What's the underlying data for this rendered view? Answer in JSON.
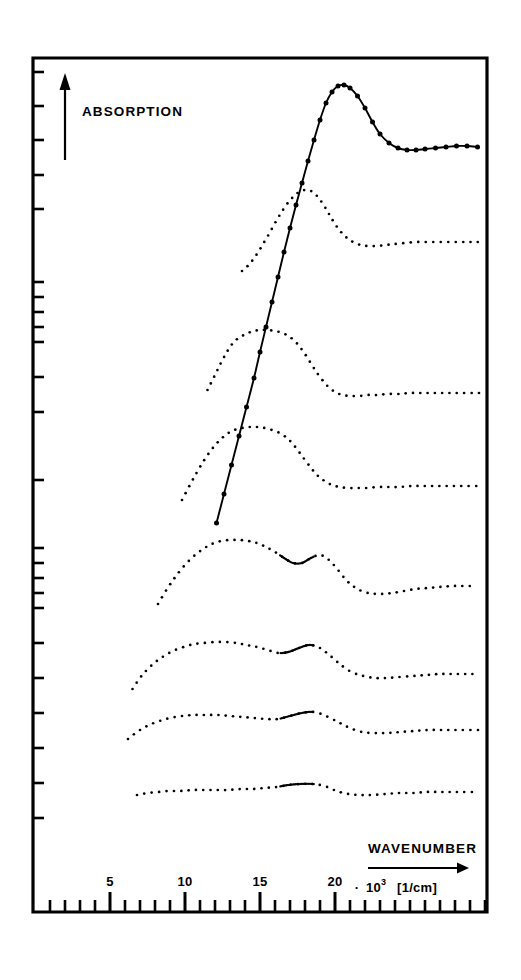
{
  "figure": {
    "title_visible": "",
    "background_color": "#ffffff",
    "ink_color": "#000000",
    "frame": {
      "left": 33,
      "top": 58,
      "right": 487,
      "bottom": 912
    }
  },
  "axes": {
    "y_label": "ABSORPTION",
    "y_arrow": "up-arrow",
    "x_label": "WAVENUMBER",
    "x_arrow": "right-arrow",
    "x_unit_prefix": "·",
    "x_unit_mantissa": "10",
    "x_unit_exponent": "3",
    "x_unit_bracket": "[1/cm]",
    "x_tick_labels": [
      "5",
      "10",
      "15",
      "20"
    ],
    "x_tick_values": [
      5,
      10,
      15,
      20
    ],
    "x_minor_step": 1,
    "x_minor_values": [
      1,
      2,
      3,
      4,
      5,
      6,
      7,
      8,
      9,
      10,
      11,
      12,
      13,
      14,
      15,
      16,
      17,
      18,
      19,
      20,
      21,
      22,
      23,
      24,
      25,
      26,
      27,
      28,
      29,
      30
    ],
    "y_tick_positions": [
      72,
      106,
      140,
      175,
      209,
      282,
      297,
      312,
      327,
      342,
      377,
      412,
      480,
      548,
      563,
      578,
      593,
      608,
      643,
      678,
      713,
      748,
      783,
      818
    ],
    "y_ticks_labeled": false
  },
  "chart_data": {
    "type": "line",
    "xlabel": "WAVENUMBER · 10^3 [1/cm]",
    "ylabel": "ABSORPTION",
    "xlim": [
      1,
      31
    ],
    "grid": false,
    "legend": "none",
    "x_pixel_scale": {
      "x_at_value_5": 110,
      "pixels_per_unit": 15
    },
    "series": [
      {
        "name": "spectrum-1",
        "style": "solid-with-markers",
        "marker": "filled-circle",
        "x": [
          12.1,
          12.6,
          13.1,
          13.6,
          14.1,
          14.6,
          15.0,
          15.4,
          15.8,
          16.2,
          16.6,
          17.0,
          17.4,
          17.8,
          18.2,
          18.6,
          19.0,
          19.4,
          19.8,
          20.2,
          20.6,
          21.0,
          21.5,
          22.0,
          22.5,
          23.0,
          23.6,
          24.2,
          24.8,
          25.4,
          26.0,
          26.7,
          27.4,
          28.1,
          28.8,
          29.5
        ],
        "y_pixels": [
          523,
          494,
          465,
          436,
          407,
          378,
          352,
          327,
          302,
          277,
          252,
          228,
          205,
          183,
          161,
          140,
          120,
          103,
          92,
          86,
          85,
          88,
          96,
          108,
          122,
          134,
          143,
          148,
          150,
          150,
          149,
          148,
          147,
          146,
          146,
          147
        ]
      },
      {
        "name": "spectrum-2",
        "style": "dotted",
        "x": [
          13.8,
          14.3,
          14.8,
          15.2,
          15.6,
          16.0,
          16.4,
          16.8,
          17.2,
          17.6,
          18.0,
          18.4,
          18.8,
          19.2,
          19.6,
          20.0,
          20.4,
          20.8,
          21.2,
          21.7,
          22.2,
          22.8,
          23.4,
          24.0,
          24.7,
          25.4,
          26.1,
          26.8,
          27.5,
          28.2,
          28.9,
          29.6
        ],
        "y_pixels": [
          271,
          264,
          254,
          244,
          234,
          223,
          213,
          204,
          197,
          192,
          190,
          191,
          196,
          204,
          214,
          224,
          232,
          238,
          242,
          245,
          246,
          246,
          245,
          244,
          243,
          242,
          242,
          242,
          242,
          242,
          242,
          242
        ]
      },
      {
        "name": "spectrum-3",
        "style": "dotted",
        "x": [
          11.5,
          12.0,
          12.5,
          13.0,
          13.4,
          13.8,
          14.2,
          14.6,
          15.0,
          15.5,
          16.0,
          16.5,
          17.0,
          17.5,
          18.0,
          18.5,
          19.0,
          19.5,
          20.0,
          20.5,
          21.0,
          21.6,
          22.2,
          22.8,
          23.5,
          24.2,
          25.0,
          25.8,
          26.6,
          27.4,
          28.2,
          29.0,
          29.7
        ],
        "y_pixels": [
          390,
          375,
          360,
          347,
          340,
          336,
          333,
          331,
          330,
          330,
          331,
          333,
          337,
          344,
          354,
          366,
          377,
          386,
          392,
          395,
          396,
          396,
          395,
          395,
          394,
          394,
          393,
          393,
          393,
          393,
          393,
          393,
          393
        ]
      },
      {
        "name": "spectrum-4",
        "style": "dotted",
        "x": [
          9.8,
          10.4,
          11.0,
          11.6,
          12.2,
          12.8,
          13.3,
          13.8,
          14.3,
          14.8,
          15.3,
          15.8,
          16.3,
          16.8,
          17.3,
          17.8,
          18.3,
          18.8,
          19.3,
          19.8,
          20.3,
          20.9,
          21.5,
          22.1,
          22.8,
          23.5,
          24.3,
          25.1,
          25.9,
          26.7,
          27.5,
          28.3,
          29.1,
          29.8
        ],
        "y_pixels": [
          500,
          483,
          467,
          453,
          442,
          434,
          430,
          428,
          427,
          427,
          428,
          430,
          433,
          438,
          446,
          456,
          466,
          475,
          481,
          485,
          487,
          488,
          488,
          488,
          487,
          487,
          487,
          486,
          486,
          486,
          486,
          486,
          486,
          486
        ]
      },
      {
        "name": "spectrum-5",
        "style": "dotted",
        "x": [
          8.2,
          8.8,
          9.4,
          10.0,
          10.6,
          11.2,
          11.8,
          12.4,
          13.0,
          13.6,
          14.2,
          14.8,
          15.4,
          16.0,
          16.6,
          17.2,
          17.8,
          18.4,
          19.0,
          19.6,
          20.2,
          20.8,
          21.5,
          22.2,
          23.0,
          23.8,
          24.6,
          25.4,
          26.2,
          27.0,
          27.8,
          28.6,
          29.4
        ],
        "y_pixels": [
          604,
          589,
          576,
          565,
          556,
          549,
          544,
          541,
          540,
          540,
          541,
          543,
          547,
          552,
          558,
          563,
          563,
          558,
          555,
          560,
          570,
          581,
          589,
          593,
          594,
          593,
          591,
          589,
          588,
          587,
          586,
          586,
          586
        ]
      },
      {
        "name": "spectrum-6",
        "style": "dotted",
        "x": [
          6.5,
          7.1,
          7.8,
          8.5,
          9.2,
          9.9,
          10.6,
          11.3,
          12.0,
          12.7,
          13.4,
          14.1,
          14.8,
          15.5,
          16.2,
          16.9,
          17.6,
          18.3,
          19.0,
          19.7,
          20.4,
          21.1,
          21.9,
          22.7,
          23.5,
          24.3,
          25.2,
          26.1,
          27.0,
          27.9,
          28.8,
          29.6
        ],
        "y_pixels": [
          689,
          676,
          665,
          657,
          651,
          647,
          644,
          643,
          642,
          642,
          643,
          645,
          647,
          650,
          653,
          652,
          648,
          645,
          648,
          656,
          665,
          672,
          676,
          678,
          678,
          677,
          676,
          675,
          674,
          674,
          674,
          674
        ]
      },
      {
        "name": "spectrum-7",
        "style": "dotted",
        "x": [
          6.2,
          6.9,
          7.6,
          8.3,
          9.0,
          9.8,
          10.6,
          11.4,
          12.2,
          13.0,
          13.8,
          14.6,
          15.4,
          16.2,
          17.0,
          17.8,
          18.6,
          19.4,
          20.2,
          21.0,
          21.8,
          22.6,
          23.5,
          24.4,
          25.3,
          26.2,
          27.1,
          28.0,
          28.9,
          29.7
        ],
        "y_pixels": [
          739,
          731,
          725,
          721,
          718,
          716,
          715,
          715,
          715,
          716,
          717,
          718,
          719,
          719,
          716,
          713,
          712,
          716,
          722,
          728,
          732,
          733,
          733,
          732,
          731,
          730,
          730,
          730,
          730,
          730
        ]
      },
      {
        "name": "spectrum-8",
        "style": "dotted",
        "x": [
          6.8,
          7.5,
          8.2,
          8.9,
          9.7,
          10.5,
          11.3,
          12.1,
          12.9,
          13.7,
          14.5,
          15.3,
          16.1,
          16.9,
          17.7,
          18.5,
          19.3,
          20.1,
          20.9,
          21.7,
          22.5,
          23.4,
          24.3,
          25.2,
          26.1,
          27.0,
          27.9,
          28.8,
          29.6
        ],
        "y_pixels": [
          795,
          793,
          792,
          791,
          791,
          790,
          790,
          790,
          790,
          789,
          789,
          788,
          787,
          785,
          784,
          784,
          786,
          791,
          794,
          795,
          795,
          794,
          793,
          793,
          792,
          792,
          792,
          792,
          792
        ]
      }
    ]
  }
}
